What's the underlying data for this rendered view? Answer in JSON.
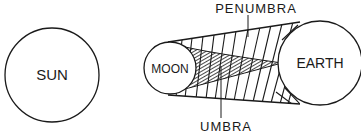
{
  "diagram": {
    "type": "solar-eclipse",
    "bodies": {
      "sun": {
        "label": "SUN"
      },
      "moon": {
        "label": "MOON"
      },
      "earth": {
        "label": "EARTH"
      }
    },
    "regions": {
      "penumbra": {
        "label": "PENUMBRA"
      },
      "umbra": {
        "label": "UMBRA"
      }
    },
    "colors": {
      "ink": "#1a1a1a",
      "background": "#ffffff"
    }
  }
}
